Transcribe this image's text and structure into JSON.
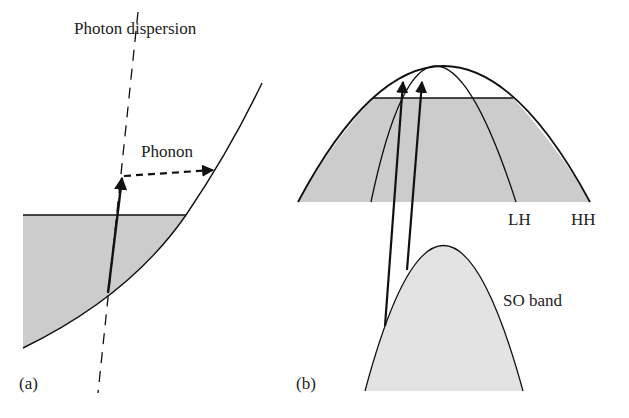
{
  "figure": {
    "panel_a": {
      "tag": "(a)",
      "photon_label": "Photon dispersion",
      "phonon_label": "Phonon",
      "elements": [
        "conduction-band curve",
        "filled states region",
        "photon dispersion line (dashed)",
        "vertical optical transition arrow",
        "phonon-assisted transition arrow (dashed)"
      ]
    },
    "panel_b": {
      "tag": "(b)",
      "bands": [
        "LH",
        "HH",
        "SO band"
      ],
      "labels": {
        "lh": "LH",
        "hh": "HH",
        "so": "SO band"
      },
      "elements": [
        "heavy-hole band",
        "light-hole band",
        "filled states region",
        "split-off band",
        "two intervalence transition arrows"
      ]
    },
    "colors": {
      "line": "#111111",
      "fill_a": "#cccccc",
      "fill_b": "#cccccc",
      "fill_so": "#e3e3e3",
      "text": "#222222"
    }
  }
}
